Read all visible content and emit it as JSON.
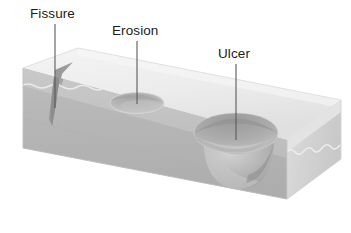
{
  "figure": {
    "background_color": "#ffffff",
    "width": 351,
    "height": 233
  },
  "labels": [
    {
      "id": "fissure",
      "text": "Fissure",
      "text_x": 30,
      "text_y": 18,
      "leader": {
        "x1": 55,
        "y1": 24,
        "x2": 55,
        "y2": 108
      }
    },
    {
      "id": "erosion",
      "text": "Erosion",
      "text_x": 112,
      "text_y": 35,
      "leader": {
        "x1": 137,
        "y1": 41,
        "x2": 137,
        "y2": 104
      }
    },
    {
      "id": "ulcer",
      "text": "Ulcer",
      "text_x": 218,
      "text_y": 58,
      "leader": {
        "x1": 236,
        "y1": 64,
        "x2": 236,
        "y2": 140
      }
    }
  ],
  "block": {
    "name": "tissue-block",
    "description": "Isometric slab of mucosa with epithelium and submucosa layers",
    "top_face_color": "#ececec",
    "top_face_shadow_color": "#dedede",
    "front_face_color": "#b6b6b6",
    "front_face_dark_color": "#a8a8a8",
    "right_face_color": "#d4d4d4",
    "right_face_shadow_color": "#c2c2c2",
    "epithelium_band_color": "#c6c6c6",
    "wavy_line_color": "#ededed",
    "edge_line_color": "#d8d8d8",
    "geometry": {
      "top_back_left": [
        78,
        48
      ],
      "top_back_right": [
        341,
        100
      ],
      "top_front_right": [
        287,
        140
      ],
      "top_front_left": [
        23,
        68
      ],
      "front_bottom_left": [
        23,
        148
      ],
      "front_bottom_right": [
        287,
        199
      ],
      "right_bottom": [
        341,
        159
      ]
    }
  },
  "lesions": [
    {
      "id": "fissure",
      "name": "fissure-crack",
      "type": "crack",
      "depth_description": "narrow cleft extending from surface down through epithelium into submucosa",
      "color": "#8d8d8d"
    },
    {
      "id": "erosion",
      "name": "erosion-depression",
      "type": "shallow-oval-depression",
      "center": [
        137,
        103
      ],
      "rx": 27,
      "ry": 10,
      "depth_description": "shallow saucer-shaped loss of superficial epithelium only",
      "color": "#b9b9b9"
    },
    {
      "id": "ulcer",
      "name": "ulcer-crater",
      "type": "deep-crater",
      "center": [
        236,
        133
      ],
      "rx": 42,
      "ry": 22,
      "depth_description": "deep crater breaching full epithelium into underlying connective tissue",
      "color": "#a9a9a9"
    }
  ],
  "icon_names": {
    "leader_line": "leader-line",
    "fissure_crack": "fissure-crack-icon",
    "erosion_pit": "erosion-pit-icon",
    "ulcer_crater": "ulcer-crater-icon"
  }
}
